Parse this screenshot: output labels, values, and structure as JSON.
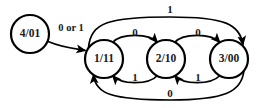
{
  "diagram": {
    "type": "state-transition-diagram",
    "background_color": "#ffffff",
    "stroke_color": "#000000",
    "text_color": "#1a1a1a",
    "states": [
      {
        "id": "s4",
        "label": "4/01",
        "cx": 30,
        "cy": 34,
        "r": 19
      },
      {
        "id": "s1",
        "label": "1/11",
        "cx": 104,
        "cy": 59,
        "r": 19
      },
      {
        "id": "s2",
        "label": "2/10",
        "cx": 166,
        "cy": 59,
        "r": 19
      },
      {
        "id": "s3",
        "label": "3/00",
        "cx": 229,
        "cy": 59,
        "r": 19
      }
    ],
    "transitions": [
      {
        "id": "t_4_1",
        "from": "s4",
        "to": "s1",
        "label": "0 or 1",
        "label_x": 71,
        "label_y": 29
      },
      {
        "id": "t_1_2",
        "from": "s1",
        "to": "s2",
        "label": "0",
        "label_x": 135,
        "label_y": 33
      },
      {
        "id": "t_2_1",
        "from": "s2",
        "to": "s1",
        "label": "1",
        "label_y": 78,
        "label_x": 135
      },
      {
        "id": "t_2_3",
        "from": "s2",
        "to": "s3",
        "label": "0",
        "label_x": 198,
        "label_y": 33
      },
      {
        "id": "t_3_2",
        "from": "s3",
        "to": "s2",
        "label": "1",
        "label_x": 198,
        "label_y": 78
      },
      {
        "id": "t_1_3",
        "from": "s1",
        "to": "s3",
        "label": "1",
        "label_x": 170,
        "label_y": 11
      },
      {
        "id": "t_3_1",
        "from": "s3",
        "to": "s1",
        "label": "0",
        "label_x": 170,
        "label_y": 94
      }
    ]
  }
}
